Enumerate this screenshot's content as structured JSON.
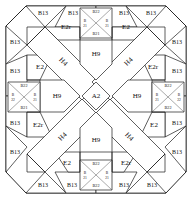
{
  "diagram": {
    "center": {
      "label": "A2"
    },
    "colors": {
      "line": "#1a1a1a",
      "fill": "#ffffff",
      "background": "#ffffff"
    },
    "bars": [
      {
        "name": "diagonal-bar-nw",
        "label": "H4"
      },
      {
        "name": "diagonal-bar-ne",
        "label": "H4"
      },
      {
        "name": "diagonal-bar-sw",
        "label": "H4"
      },
      {
        "name": "diagonal-bar-se",
        "label": "H4"
      }
    ],
    "houses": [
      {
        "name": "house-north",
        "label": "H9"
      },
      {
        "name": "house-west",
        "label": "H9"
      },
      {
        "name": "house-east",
        "label": "H9"
      },
      {
        "name": "house-south",
        "label": "H9"
      }
    ],
    "parallelograms": [
      {
        "name": "par-top-left",
        "label": "E2r"
      },
      {
        "name": "par-top-right",
        "label": "E2"
      },
      {
        "name": "par-left-upper",
        "label": "E2"
      },
      {
        "name": "par-right-upper",
        "label": "E2r"
      },
      {
        "name": "par-left-lower",
        "label": "E2r"
      },
      {
        "name": "par-right-lower",
        "label": "E2"
      },
      {
        "name": "par-bottom-left",
        "label": "E2"
      },
      {
        "name": "par-bottom-right",
        "label": "E2r"
      }
    ],
    "triangles": [
      {
        "name": "tri-top-1",
        "label": "B13"
      },
      {
        "name": "tri-top-2",
        "label": "B13"
      },
      {
        "name": "tri-top-3",
        "label": "B13"
      },
      {
        "name": "tri-top-4",
        "label": "B13"
      },
      {
        "name": "tri-left-1",
        "label": "B13"
      },
      {
        "name": "tri-left-2",
        "label": "B13"
      },
      {
        "name": "tri-left-3",
        "label": "B13"
      },
      {
        "name": "tri-left-4",
        "label": "B13"
      },
      {
        "name": "tri-right-1",
        "label": "B13"
      },
      {
        "name": "tri-right-2",
        "label": "B13"
      },
      {
        "name": "tri-right-3",
        "label": "B13"
      },
      {
        "name": "tri-right-4",
        "label": "B13"
      },
      {
        "name": "tri-bottom-1",
        "label": "B13"
      },
      {
        "name": "tri-bottom-2",
        "label": "B13"
      },
      {
        "name": "tri-bottom-3",
        "label": "B13"
      },
      {
        "name": "tri-bottom-4",
        "label": "B13"
      }
    ],
    "star_squares": [
      {
        "name": "star-square-north",
        "top": "B22",
        "bottom": "B21",
        "left_upper": "B",
        "left_lower": "21",
        "right_upper": "B",
        "right_lower": "21"
      },
      {
        "name": "star-square-west",
        "top": "B22",
        "bottom": "B21",
        "left_upper": "B",
        "left_lower": "22",
        "right_upper": "B",
        "right_lower": "21"
      },
      {
        "name": "star-square-east",
        "top": "B22",
        "bottom": "B22",
        "left_upper": "B",
        "left_lower": "21",
        "right_upper": "B",
        "right_lower": "22"
      },
      {
        "name": "star-square-south",
        "top": "B22",
        "bottom": "B22",
        "left_upper": "B",
        "left_lower": "21",
        "right_upper": "B",
        "right_lower": "21"
      }
    ]
  }
}
